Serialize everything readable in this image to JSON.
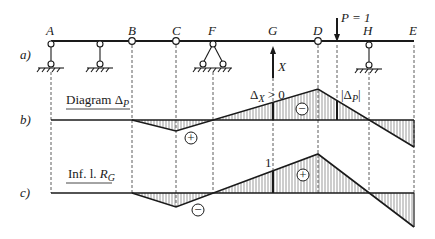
{
  "parts": {
    "a": {
      "label": "a)"
    },
    "b": {
      "label": "b)",
      "title_main": "Diagram ",
      "title_sym": "Δ",
      "title_sub": "P"
    },
    "c": {
      "label": "c)",
      "title_main": "Inf. l. ",
      "title_sym": "R",
      "title_sub": "G"
    }
  },
  "beam": {
    "points": [
      {
        "name": "A",
        "x": 51
      },
      {
        "name": "B",
        "x": 132
      },
      {
        "name": "C",
        "x": 176
      },
      {
        "name": "F",
        "x": 213
      },
      {
        "name": "G",
        "x": 273
      },
      {
        "name": "D",
        "x": 318
      },
      {
        "name": "H",
        "x": 369
      },
      {
        "name": "E",
        "x": 414
      }
    ],
    "load_label": "P = 1",
    "redundant_label": "X"
  },
  "annotations": {
    "delta_x": "Δ",
    "delta_x_sub": "X",
    "delta_x_rel": " > 0",
    "delta_p_bar_open": "|",
    "delta_p": "Δ",
    "delta_p_sub": "P",
    "delta_p_bar_close": "|",
    "unit_value": "1",
    "sign_plus": "+",
    "sign_minus": "−"
  },
  "colors": {
    "ink": "#1a1a1a",
    "hatch": "#555555"
  }
}
